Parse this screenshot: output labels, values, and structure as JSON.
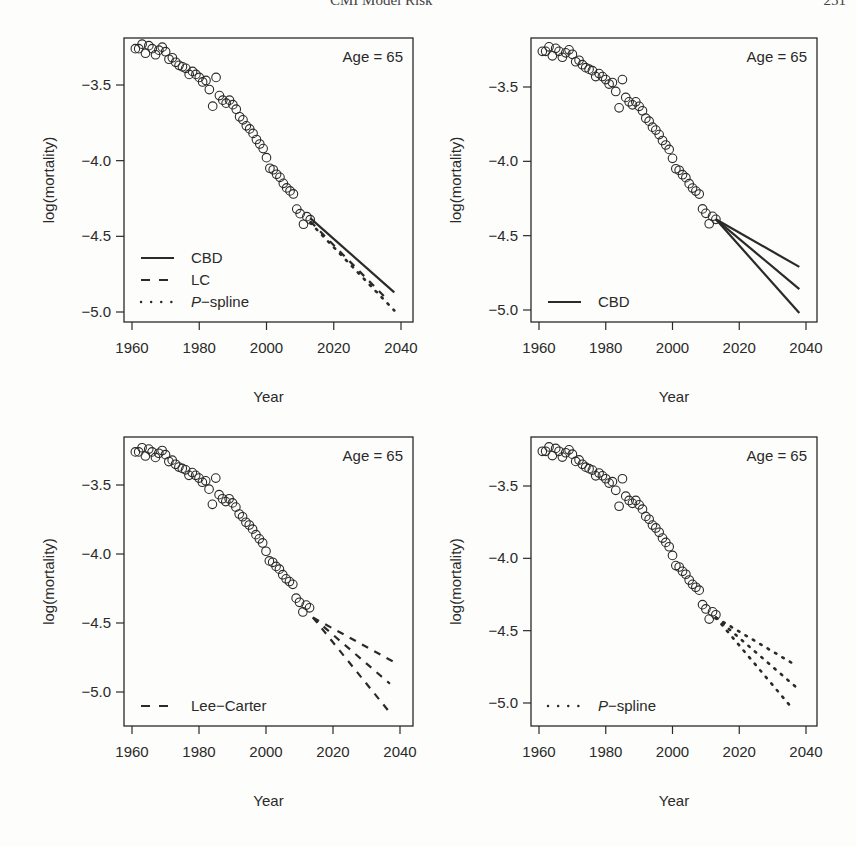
{
  "header": {
    "title": "CMI Model Risk",
    "page_number": "251"
  },
  "colors": {
    "ink": "#2a2a2a",
    "background": "#fdfdfb"
  },
  "chart_data": [
    {
      "type": "scatter",
      "panel": "top-left",
      "title": "",
      "annotation": "Age = 65",
      "xlabel": "Year",
      "ylabel": "log(mortality)",
      "xlim": [
        1959,
        2041
      ],
      "ylim": [
        -5.1,
        -3.24
      ],
      "xticks": [
        1960,
        1980,
        2000,
        2020,
        2040
      ],
      "yticks": [
        -3.5,
        -4.0,
        -4.5,
        -5.0
      ],
      "ytick_labels": [
        "−3.5",
        "−4.0",
        "−4.5",
        "−5.0"
      ],
      "legend": {
        "position": "bottom-left",
        "entries": [
          {
            "label": "CBD",
            "style": "solid"
          },
          {
            "label": "LC",
            "style": "dashed"
          },
          {
            "label": "P−spline",
            "style": "dotted",
            "italic_prefix": "P"
          }
        ]
      },
      "observed": {
        "name": "observed",
        "marker": "open-circle"
      },
      "series": [
        {
          "name": "CBD",
          "style": "solid",
          "x": [
            2013,
            2038
          ],
          "y": [
            -4.38,
            -4.87
          ]
        },
        {
          "name": "LC",
          "style": "dashed",
          "x": [
            2013,
            2036
          ],
          "y": [
            -4.4,
            -4.92
          ]
        },
        {
          "name": "P-spline",
          "style": "dotted",
          "x": [
            2013,
            2038
          ],
          "y": [
            -4.41,
            -4.99
          ]
        }
      ]
    },
    {
      "type": "scatter",
      "panel": "top-right",
      "annotation": "Age = 65",
      "xlabel": "Year",
      "ylabel": "log(mortality)",
      "xlim": [
        1959,
        2041
      ],
      "ylim": [
        -5.1,
        -3.24
      ],
      "xticks": [
        1960,
        1980,
        2000,
        2020,
        2040
      ],
      "yticks": [
        -3.5,
        -4.0,
        -4.5,
        -5.0
      ],
      "ytick_labels": [
        "−3.5",
        "−4.0",
        "−4.5",
        "−5.0"
      ],
      "legend": {
        "position": "bottom-left",
        "entries": [
          {
            "label": "CBD",
            "style": "solid"
          }
        ]
      },
      "observed": {
        "name": "observed",
        "marker": "open-circle"
      },
      "series": [
        {
          "name": "CBD upper",
          "style": "solid",
          "x": [
            2013,
            2038
          ],
          "y": [
            -4.39,
            -4.71
          ]
        },
        {
          "name": "CBD central",
          "style": "solid",
          "x": [
            2013,
            2038
          ],
          "y": [
            -4.39,
            -4.86
          ]
        },
        {
          "name": "CBD lower",
          "style": "solid",
          "x": [
            2013,
            2038
          ],
          "y": [
            -4.39,
            -5.02
          ]
        }
      ]
    },
    {
      "type": "scatter",
      "panel": "bottom-left",
      "annotation": "Age = 65",
      "xlabel": "Year",
      "ylabel": "log(mortality)",
      "xlim": [
        1959,
        2041
      ],
      "ylim": [
        -5.24,
        -3.22
      ],
      "xticks": [
        1960,
        1980,
        2000,
        2020,
        2040
      ],
      "yticks": [
        -3.5,
        -4.0,
        -4.5,
        -5.0
      ],
      "ytick_labels": [
        "−3.5",
        "−4.0",
        "−4.5",
        "−5.0"
      ],
      "legend": {
        "position": "bottom-left",
        "entries": [
          {
            "label": "Lee−Carter",
            "style": "dashed"
          }
        ]
      },
      "observed": {
        "name": "observed",
        "marker": "open-circle"
      },
      "series": [
        {
          "name": "LC upper",
          "style": "dashed",
          "x": [
            2014,
            2038
          ],
          "y": [
            -4.46,
            -4.78
          ]
        },
        {
          "name": "LC central",
          "style": "dashed",
          "x": [
            2014,
            2037
          ],
          "y": [
            -4.46,
            -4.94
          ]
        },
        {
          "name": "LC lower",
          "style": "dashed",
          "x": [
            2014,
            2037
          ],
          "y": [
            -4.46,
            -5.15
          ]
        }
      ]
    },
    {
      "type": "scatter",
      "panel": "bottom-right",
      "annotation": "Age = 65",
      "xlabel": "Year",
      "ylabel": "log(mortality)",
      "xlim": [
        1959,
        2041
      ],
      "ylim": [
        -5.17,
        -3.2
      ],
      "xticks": [
        1960,
        1980,
        2000,
        2020,
        2040
      ],
      "yticks": [
        -3.5,
        -4.0,
        -4.5,
        -5.0
      ],
      "ytick_labels": [
        "−3.5",
        "−4.0",
        "−4.5",
        "−5.0"
      ],
      "legend": {
        "position": "bottom-left",
        "entries": [
          {
            "label": "P−spline",
            "style": "dotted",
            "italic_prefix": "P"
          }
        ]
      },
      "observed": {
        "name": "observed",
        "marker": "open-circle"
      },
      "series": [
        {
          "name": "P-spline upper",
          "style": "dotted",
          "x": [
            2013,
            2037
          ],
          "y": [
            -4.41,
            -4.74
          ]
        },
        {
          "name": "P-spline central",
          "style": "dotted",
          "x": [
            2013,
            2037
          ],
          "y": [
            -4.41,
            -4.89
          ]
        },
        {
          "name": "P-spline lower",
          "style": "dotted",
          "x": [
            2013,
            2036
          ],
          "y": [
            -4.41,
            -5.04
          ]
        }
      ]
    }
  ],
  "observed_data": {
    "x": [
      1961,
      1962,
      1963,
      1964,
      1965,
      1966,
      1967,
      1968,
      1969,
      1970,
      1971,
      1972,
      1973,
      1974,
      1975,
      1976,
      1977,
      1978,
      1979,
      1980,
      1981,
      1982,
      1983,
      1984,
      1985,
      1986,
      1987,
      1988,
      1989,
      1990,
      1991,
      1992,
      1993,
      1994,
      1995,
      1996,
      1997,
      1998,
      1999,
      2000,
      2001,
      2002,
      2003,
      2004,
      2005,
      2006,
      2007,
      2008,
      2009,
      2010,
      2011,
      2012,
      2013
    ],
    "y": [
      -3.26,
      -3.26,
      -3.23,
      -3.29,
      -3.24,
      -3.26,
      -3.3,
      -3.27,
      -3.25,
      -3.28,
      -3.33,
      -3.32,
      -3.35,
      -3.37,
      -3.38,
      -3.39,
      -3.43,
      -3.41,
      -3.43,
      -3.45,
      -3.48,
      -3.47,
      -3.53,
      -3.64,
      -3.45,
      -3.57,
      -3.6,
      -3.62,
      -3.6,
      -3.63,
      -3.66,
      -3.71,
      -3.73,
      -3.77,
      -3.79,
      -3.82,
      -3.86,
      -3.89,
      -3.92,
      -3.98,
      -4.05,
      -4.06,
      -4.09,
      -4.11,
      -4.15,
      -4.18,
      -4.2,
      -4.22,
      -4.32,
      -4.35,
      -4.42,
      -4.37,
      -4.39
    ]
  },
  "panels": [
    {
      "id": "top-left",
      "box": [
        124,
        38,
        413,
        322
      ],
      "x_px": [
        132,
        401
      ],
      "y_px": {
        "-3.5": 85,
        "-5.0": 312
      }
    },
    {
      "id": "top-right",
      "box": [
        531,
        38,
        817,
        322
      ],
      "x_px": [
        539,
        806
      ],
      "y_px": {
        "-3.5": 87,
        "-5.0": 310
      }
    },
    {
      "id": "bottom-left",
      "box": [
        124,
        437,
        413,
        726
      ],
      "x_px": [
        132,
        400
      ],
      "y_px": {
        "-3.5": 485,
        "-5.0": 692
      }
    },
    {
      "id": "bottom-right",
      "box": [
        531,
        437,
        817,
        726
      ],
      "x_px": [
        539,
        806
      ],
      "y_px": {
        "-3.5": 486,
        "-5.0": 703
      }
    }
  ]
}
